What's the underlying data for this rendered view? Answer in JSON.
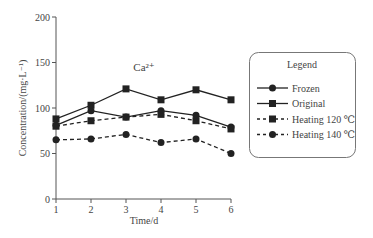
{
  "chart_data": {
    "type": "line",
    "title": "Ca²⁺",
    "xlabel": "Time/d",
    "ylabel": "Concentration/(mg·L⁻¹)",
    "x": [
      1,
      2,
      3,
      4,
      5,
      6
    ],
    "xlim": [
      1,
      6
    ],
    "ylim": [
      0,
      200
    ],
    "yticks": [
      0,
      50,
      100,
      150,
      200
    ],
    "xticks": [
      1,
      2,
      3,
      4,
      5,
      6
    ],
    "grid": false,
    "legend_position": "right",
    "legend_title": "Legend",
    "series": [
      {
        "name": "Frozen",
        "values": [
          81,
          97,
          90,
          97,
          92,
          79
        ],
        "marker": "circle",
        "line": "solid"
      },
      {
        "name": "Original",
        "values": [
          88,
          103,
          121,
          109,
          120,
          109
        ],
        "marker": "square",
        "line": "solid"
      },
      {
        "name": "Heating 120 ℃",
        "values": [
          80,
          86,
          90,
          93,
          86,
          77
        ],
        "marker": "square",
        "line": "dashed"
      },
      {
        "name": "Heating 140 ℃",
        "values": [
          65,
          66,
          71,
          62,
          66,
          50
        ],
        "marker": "circle",
        "line": "dashed"
      }
    ]
  },
  "colors": {
    "line": "#222222",
    "axis": "#555555",
    "legend_border": "#777777"
  }
}
